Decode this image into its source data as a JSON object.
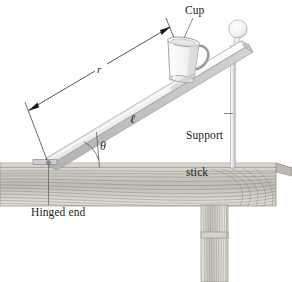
{
  "figure": {
    "background_color": "#ffffff",
    "ink_color": "#1c1c1c"
  },
  "labels": {
    "cup": "Cup",
    "support_stick_line1": "Support",
    "support_stick_line2": "stick",
    "hinged_end": "Hinged end",
    "theta": "θ",
    "ell": "ℓ",
    "r": "r"
  },
  "colors": {
    "plank_light": "#f2f2f2",
    "plank_mid": "#d8d8d8",
    "plank_dark": "#a8a8a8",
    "wood_light": "#e9e7e2",
    "wood_mid": "#c9c6bf",
    "wood_dark": "#8e8a82",
    "grain_line": "#6f6b63",
    "cup_body": "#fbfbfb",
    "cup_shade": "#dcdcdc",
    "stick": "#e4e4e4",
    "stick_edge": "#b0b0b0",
    "ball": "#f6f6f6",
    "leader_line": "#5a5a5a",
    "dimension_line": "#2a2a2a"
  },
  "geometry": {
    "plank_hinge_point": [
      48,
      163
    ],
    "plank_top_point": [
      243,
      45
    ],
    "angle_theta_degrees": 31,
    "table_top_y": 168,
    "table_bottom_y": 205,
    "table_left_x": 0,
    "table_right_x": 276,
    "stick_x": 233,
    "stick_top_y": 52,
    "stick_bottom_y": 168,
    "ball_center": [
      238,
      29
    ],
    "ball_radius": 9,
    "leg_left_x": 201,
    "leg_right_x": 228,
    "leg_bottom_y": 282
  },
  "parts": [
    {
      "name": "inclined-plank",
      "description": "Long flat board hinged at the lower-left end, raised at upper right"
    },
    {
      "name": "cup",
      "description": "Tapered mug with handle resting on the plank"
    },
    {
      "name": "support-stick",
      "description": "Thin vertical pole with ball finial holding up the plank"
    },
    {
      "name": "table-top",
      "description": "Horizontal wooden bench surface with grain"
    },
    {
      "name": "table-leg",
      "description": "Vertical wooden leg under the bench"
    },
    {
      "name": "dimension-r",
      "description": "Double-headed arrow measuring distance r from hinge to cup"
    },
    {
      "name": "angle-arc-theta",
      "description": "Arc marking angle theta between plank and table"
    }
  ]
}
